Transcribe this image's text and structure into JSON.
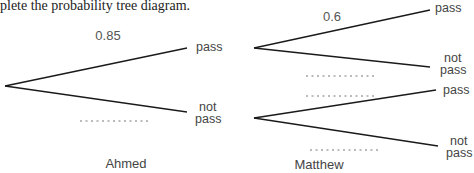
{
  "instruction": "plete the probability tree diagram.",
  "ahmed": {
    "name": "Ahmed",
    "branches": [
      {
        "outcome": "pass",
        "probability": "0.85"
      },
      {
        "outcome_line1": "not",
        "outcome_line2": "pass",
        "probability": ""
      }
    ]
  },
  "matthew": {
    "name": "Matthew",
    "after_pass": [
      {
        "outcome": "pass",
        "probability": "0.6"
      },
      {
        "outcome_line1": "not",
        "outcome_line2": "pass",
        "probability": ""
      }
    ],
    "after_not_pass": [
      {
        "outcome": "pass",
        "probability": ""
      },
      {
        "outcome_line1": "not",
        "outcome_line2": "pass",
        "probability": ""
      }
    ]
  },
  "blank_placeholder": "..........",
  "colors": {
    "line": "#1a1a1a",
    "text": "#444444",
    "blank": "#777777"
  }
}
